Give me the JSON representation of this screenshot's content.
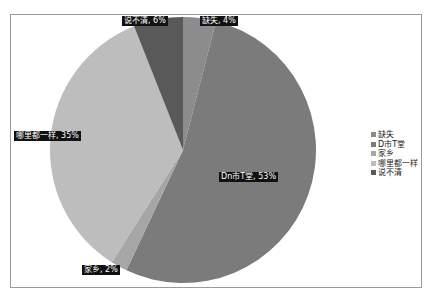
{
  "chart_data": {
    "type": "pie",
    "title": "",
    "categories": [
      "缺失",
      "D市T堂",
      "家乡",
      "哪里都一样",
      "说不清"
    ],
    "values": [
      4,
      53,
      2,
      35,
      6
    ],
    "unit": "%",
    "colors": [
      "#8c8c8c",
      "#7b7b7b",
      "#a6a6a6",
      "#bdbdbd",
      "#595959"
    ],
    "data_labels": [
      "缺失, 4%",
      "Dn市T堂, 53%",
      "家乡, 2%",
      "哪里都一样, 35%",
      "说不清, 6%"
    ],
    "legend_position": "right",
    "start_angle_deg": 0,
    "direction": "clockwise"
  },
  "labels": {
    "l0": "缺失, 4%",
    "l1": "Dn市T堂, 53%",
    "l2": "家乡, 2%",
    "l3": "哪里都一样, 35%",
    "l4": "说不清, 6%"
  },
  "legend": {
    "items": [
      {
        "label": "缺失",
        "color": "#8c8c8c"
      },
      {
        "label": "D市T堂",
        "color": "#7b7b7b"
      },
      {
        "label": "家乡",
        "color": "#a6a6a6"
      },
      {
        "label": "哪里都一样",
        "color": "#bdbdbd"
      },
      {
        "label": "说不清",
        "color": "#595959"
      }
    ]
  }
}
